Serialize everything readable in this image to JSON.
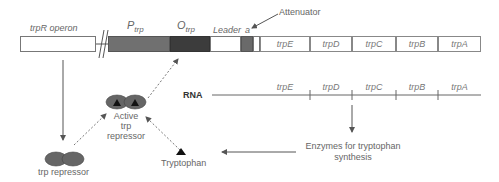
{
  "diagram": {
    "trpR_operon_label": "trpR operon",
    "promoter_label_main": "P",
    "promoter_label_sub": "trp",
    "operator_label_main": "O",
    "operator_label_sub": "trp",
    "leader_label": "Leader",
    "attenuator_short_label": "a",
    "attenuator_label": "Attenuator",
    "genes": [
      "trpE",
      "trpD",
      "trpC",
      "trpB",
      "trpA"
    ],
    "rna_label": "RNA",
    "rna_genes": [
      "trpE",
      "trpD",
      "trpC",
      "trpB",
      "trpA"
    ],
    "active_repressor_label_line1": "Active",
    "active_repressor_label_line2": "trp",
    "active_repressor_label_line3": "repressor",
    "repressor_label": "trp repressor",
    "tryptophan_label": "Tryptophan",
    "enzymes_label_line1": "Enzymes for tryptophan",
    "enzymes_label_line2": "synthesis"
  },
  "colors": {
    "promoter": "#707070",
    "operator": "#3c3c3c",
    "attenuator": "#6a6a6a",
    "repressor": "#666666",
    "line": "#666666"
  }
}
